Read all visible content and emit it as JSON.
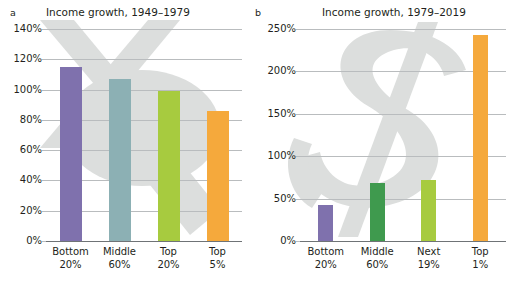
{
  "figure": {
    "panels": [
      {
        "letter": "a",
        "title": "Income growth, 1949–1979"
      },
      {
        "letter": "b",
        "title": "Income growth, 1979–2019"
      }
    ]
  },
  "colors": {
    "purple": "#7f71ad",
    "teal": "#8cb0b4",
    "green_dark": "#3f9a4e",
    "green_light": "#a7cb3f",
    "orange": "#f5a93c",
    "gridline": "#b9bcbe",
    "axis": "#6f7376",
    "text": "#231f20",
    "watermark": "#dcdedd"
  },
  "chart_data": [
    {
      "type": "bar",
      "panel": "a",
      "title": "Income growth, 1949–1979",
      "xlabel": "",
      "ylabel": "",
      "ylim": [
        0,
        140
      ],
      "yticks": [
        "0%",
        "20%",
        "40%",
        "60%",
        "80%",
        "100%",
        "120%",
        "140%"
      ],
      "ytick_values": [
        0,
        20,
        40,
        60,
        80,
        100,
        120,
        140
      ],
      "grid": true,
      "legend": "none",
      "categories": [
        "Bottom 20%",
        "Middle 60%",
        "Top 20%",
        "Top 5%"
      ],
      "category_lines": [
        [
          "Bottom",
          "20%"
        ],
        [
          "Middle",
          "60%"
        ],
        [
          "Top",
          "20%"
        ],
        [
          "Top",
          "5%"
        ]
      ],
      "values": [
        115,
        107,
        99,
        86
      ],
      "bar_colors": [
        "#7f71ad",
        "#8cb0b4",
        "#a7cb3f",
        "#f5a93c"
      ]
    },
    {
      "type": "bar",
      "panel": "b",
      "title": "Income growth, 1979–2019",
      "xlabel": "",
      "ylabel": "",
      "ylim": [
        0,
        250
      ],
      "yticks": [
        "0%",
        "50%",
        "100%",
        "150%",
        "200%",
        "250%"
      ],
      "ytick_values": [
        0,
        50,
        100,
        150,
        200,
        250
      ],
      "grid": true,
      "legend": "none",
      "categories": [
        "Bottom 20%",
        "Middle 60%",
        "Next 19%",
        "Top 1%"
      ],
      "category_lines": [
        [
          "Bottom",
          "20%"
        ],
        [
          "Middle",
          "60%"
        ],
        [
          "Next",
          "19%"
        ],
        [
          "Top",
          "1%"
        ]
      ],
      "values": [
        43,
        68,
        72,
        243
      ],
      "bar_colors": [
        "#7f71ad",
        "#3f9a4e",
        "#a7cb3f",
        "#f5a93c"
      ]
    }
  ]
}
